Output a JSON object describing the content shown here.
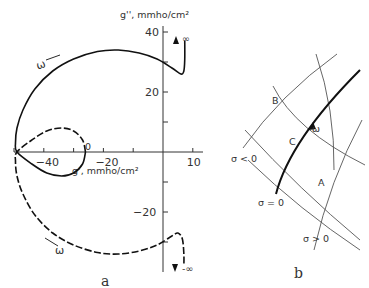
{
  "panel_a": {
    "label": "a",
    "x_axis_label": "g', mmho/cm²",
    "y_axis_label": "g'', mmho/cm²",
    "x_ticks": [
      {
        "v": -40,
        "t": "-40"
      },
      {
        "v": -20,
        "t": "-20"
      },
      {
        "v": 10,
        "t": "10"
      }
    ],
    "y_ticks": [
      {
        "v": 40,
        "t": "40"
      },
      {
        "v": 20,
        "t": "20"
      },
      {
        "v": -20,
        "t": "-20"
      }
    ],
    "minor_x": [
      -50,
      -40,
      -30,
      -20,
      -10,
      10
    ],
    "minor_y": [
      40,
      30,
      20,
      10,
      -10,
      -20,
      -30
    ],
    "zero_label": "0",
    "inf_label": "∞",
    "neg_inf_label": "-∞",
    "omega_label": "ω",
    "solid_curve": [
      [
        -26,
        0
      ],
      [
        -27,
        -4
      ],
      [
        -30,
        -7
      ],
      [
        -34,
        -8
      ],
      [
        -39,
        -7
      ],
      [
        -44,
        -4
      ],
      [
        -49,
        0
      ],
      [
        -49.5,
        3
      ],
      [
        -49,
        8
      ],
      [
        -47,
        14
      ],
      [
        -43,
        21
      ],
      [
        -37,
        27
      ],
      [
        -30,
        31
      ],
      [
        -22,
        33.5
      ],
      [
        -15,
        34
      ],
      [
        -8,
        33
      ],
      [
        -2,
        31
      ],
      [
        3,
        28
      ],
      [
        6,
        26
      ],
      [
        7,
        27
      ],
      [
        7.3,
        31
      ],
      [
        7.3,
        37
      ]
    ],
    "dashed_curve": [
      [
        -26,
        0
      ],
      [
        -27,
        4
      ],
      [
        -30,
        7
      ],
      [
        -34,
        8
      ],
      [
        -39,
        7
      ],
      [
        -44,
        4
      ],
      [
        -49,
        0
      ],
      [
        -49.5,
        -3
      ],
      [
        -49,
        -8
      ],
      [
        -47,
        -14
      ],
      [
        -43,
        -21
      ],
      [
        -37,
        -27
      ],
      [
        -30,
        -31
      ],
      [
        -22,
        -33.5
      ],
      [
        -15,
        -34
      ],
      [
        -8,
        -33
      ],
      [
        -2,
        -31
      ],
      [
        3,
        -28
      ],
      [
        5,
        -27
      ],
      [
        6.5,
        -29
      ],
      [
        7,
        -34
      ],
      [
        7,
        -38
      ]
    ]
  },
  "panel_b": {
    "label": "b",
    "points": [
      "A",
      "B",
      "C"
    ],
    "sigma_lt": "σ < 0",
    "sigma_eq": "σ = 0",
    "sigma_gt": "σ > 0",
    "omega_label": "ω"
  }
}
